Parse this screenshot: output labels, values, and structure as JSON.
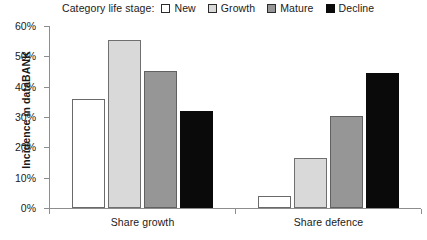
{
  "chart_data": {
    "type": "bar",
    "title": "",
    "xlabel": "",
    "ylabel": "Incidence in dataBANK",
    "ylim": [
      0,
      60
    ],
    "yticks": [
      "0%",
      "10%",
      "20%",
      "30%",
      "40%",
      "50%",
      "60%"
    ],
    "ytick_values": [
      0,
      10,
      20,
      30,
      40,
      50,
      60
    ],
    "grid": false,
    "legend_position": "top",
    "legend_title": "Category life stage:",
    "categories": [
      "Share growth",
      "Share defence"
    ],
    "series": [
      {
        "name": "New",
        "color": "#ffffff",
        "values": [
          36.0,
          4.0
        ]
      },
      {
        "name": "Growth",
        "color": "#d9d9d9",
        "values": [
          55.5,
          16.5
        ]
      },
      {
        "name": "Mature",
        "color": "#969696",
        "values": [
          45.3,
          30.3
        ]
      },
      {
        "name": "Decline",
        "color": "#0a0a0a",
        "values": [
          32.0,
          44.5
        ]
      }
    ]
  },
  "axis": {
    "y_title": "Incidence in dataBANK"
  },
  "legend": {
    "title": "Category life stage:",
    "entries": [
      {
        "label": "New"
      },
      {
        "label": "Growth"
      },
      {
        "label": "Mature"
      },
      {
        "label": "Decline"
      }
    ]
  }
}
